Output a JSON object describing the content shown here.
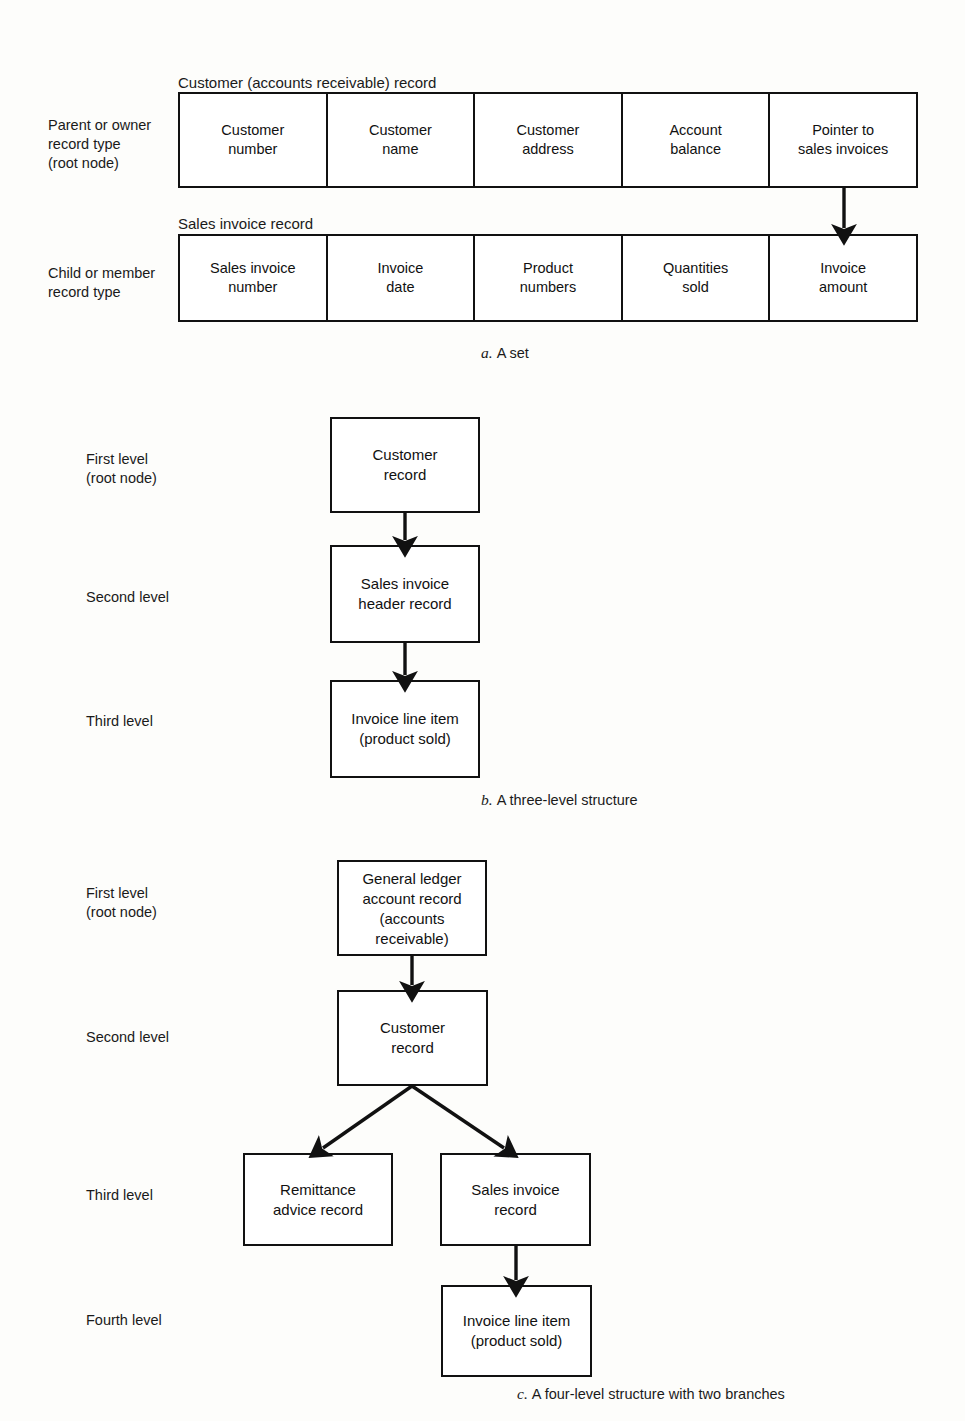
{
  "figure": {
    "type": "diagram"
  },
  "panel_a": {
    "caption_letter": "a.",
    "caption_text": "A set",
    "parent_label": "Parent or owner\nrecord type\n(root node)",
    "child_label": "Child or member\nrecord type",
    "parent_record_title": "Customer (accounts receivable) record",
    "child_record_title": "Sales invoice record",
    "parent_fields": [
      "Customer\nnumber",
      "Customer\nname",
      "Customer\naddress",
      "Account\nbalance",
      "Pointer to\nsales invoices"
    ],
    "child_fields": [
      "Sales invoice\nnumber",
      "Invoice\ndate",
      "Product\nnumbers",
      "Quantities\nsold",
      "Invoice\namount"
    ],
    "pointer_arrow": "pointer-to-sales-invoices-arrow"
  },
  "panel_b": {
    "caption_letter": "b.",
    "caption_text": "A three-level structure",
    "levels": [
      "First level\n(root node)",
      "Second level",
      "Third level"
    ],
    "nodes": [
      "Customer\nrecord",
      "Sales invoice\nheader record",
      "Invoice line item\n(product sold)"
    ]
  },
  "panel_c": {
    "caption_letter": "c.",
    "caption_text": "A four-level structure with two branches",
    "levels": [
      "First level\n(root node)",
      "Second level",
      "Third level",
      "Fourth level"
    ],
    "nodes": {
      "root": "General ledger\naccount record\n(accounts\nreceivable)",
      "second": "Customer\nrecord",
      "third_left": "Remittance\nadvice record",
      "third_right": "Sales invoice\nrecord",
      "fourth": "Invoice line item\n(product sold)"
    }
  },
  "colors": {
    "line": "#111111",
    "background": "#fdfdfb",
    "text": "#1a1a1a"
  }
}
